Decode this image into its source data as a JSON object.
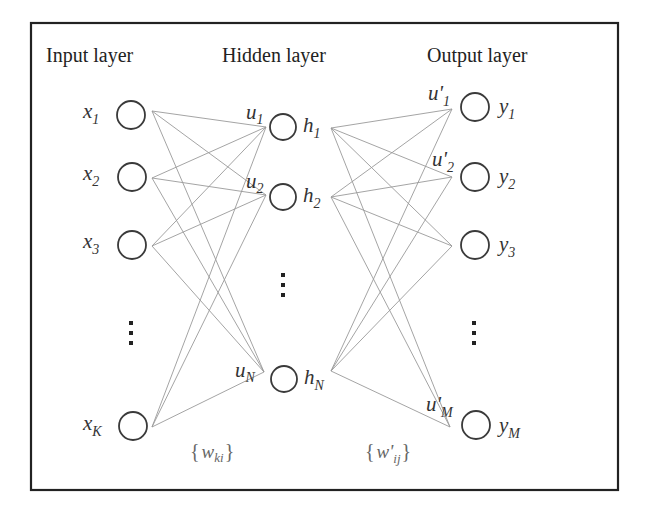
{
  "figure": {
    "headings": {
      "input": "Input layer",
      "hidden": "Hidden layer",
      "output": "Output layer"
    }
  },
  "layers": {
    "input": {
      "nodes": [
        {
          "base": "x",
          "sub": "1",
          "cx": 131,
          "cy": 115,
          "port": [
            152,
            111
          ]
        },
        {
          "base": "x",
          "sub": "2",
          "cx": 132,
          "cy": 177,
          "port": [
            152,
            178
          ]
        },
        {
          "base": "x",
          "sub": "3",
          "cx": 132,
          "cy": 245,
          "port": [
            152,
            246
          ]
        },
        {
          "base": "x",
          "sub": "K",
          "cx": 133,
          "cy": 426,
          "port": [
            152,
            427
          ]
        }
      ],
      "ellipsis": "⋮"
    },
    "hidden": {
      "nodes": [
        {
          "base": "h",
          "sub": "1",
          "in_base": "u",
          "in_sub": "1",
          "cx": 283,
          "cy": 127,
          "in_port": [
            266,
            127
          ],
          "out_port": [
            331,
            128
          ]
        },
        {
          "base": "h",
          "sub": "2",
          "in_base": "u",
          "in_sub": "2",
          "cx": 283,
          "cy": 197,
          "in_port": [
            266,
            195
          ],
          "out_port": [
            331,
            197
          ]
        },
        {
          "base": "h",
          "sub": "N",
          "in_base": "u",
          "in_sub": "N",
          "cx": 284,
          "cy": 379,
          "in_port": [
            264,
            372
          ],
          "out_port": [
            331,
            371
          ]
        }
      ],
      "ellipsis": "⋮"
    },
    "output": {
      "nodes": [
        {
          "base": "y",
          "sub": "1",
          "in_base": "u'",
          "in_sub": "1",
          "cx": 475,
          "cy": 107,
          "in_port": [
            452,
            109
          ]
        },
        {
          "base": "y",
          "sub": "2",
          "in_base": "u'",
          "in_sub": "2",
          "cx": 475,
          "cy": 177,
          "in_port": [
            452,
            177
          ]
        },
        {
          "base": "y",
          "sub": "3",
          "in_base": "",
          "in_sub": "",
          "cx": 475,
          "cy": 245,
          "in_port": [
            452,
            246
          ]
        },
        {
          "base": "y",
          "sub": "M",
          "in_base": "u'",
          "in_sub": "M",
          "cx": 476,
          "cy": 425,
          "in_port": [
            450,
            427
          ]
        }
      ],
      "ellipsis": "⋮"
    }
  },
  "weights": {
    "input_hidden": {
      "open": "{",
      "base": "w",
      "sub": "ki",
      "close": "}"
    },
    "hidden_output": {
      "open": "{",
      "base": "w'",
      "sub": "ij",
      "close": "}"
    }
  },
  "colors": {
    "frame": "#222222",
    "edge": "#9a9a9a",
    "node_stroke": "#3a3a3a",
    "text": "#333333",
    "weight_text": "#666666"
  }
}
